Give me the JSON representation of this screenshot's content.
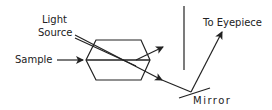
{
  "diagram": {
    "type": "microscope-optical-path",
    "labels": {
      "light_source_line1": "Light",
      "light_source_line2": "Source",
      "sample": "Sample",
      "to_eyepiece": "To Eyepiece",
      "mirror": "Mirror"
    },
    "colors": {
      "stroke": "#222222",
      "background": "#ffffff"
    }
  }
}
